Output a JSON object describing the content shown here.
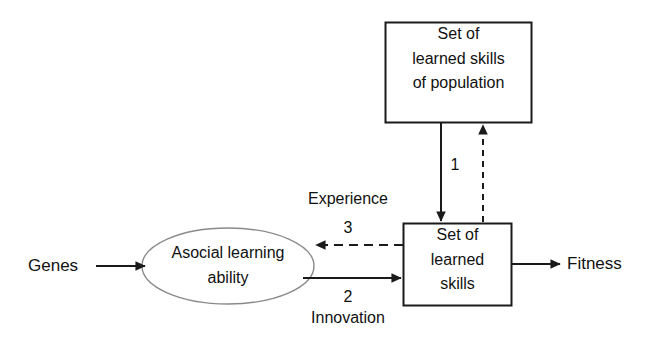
{
  "diagram": {
    "background_color": "#ffffff",
    "stroke_color": "#1a1a1a",
    "ellipse_stroke_color": "#8a8a8a",
    "text_color": "#111111",
    "nodes": {
      "population_skills": {
        "shape": "rectangle",
        "label": "Set of\nlearned skills\nof population"
      },
      "asocial_learning": {
        "shape": "ellipse",
        "label": "Asocial learning\nability"
      },
      "learned_skills": {
        "shape": "rectangle",
        "label": "Set of\nlearned\nskills"
      },
      "genes": {
        "shape": "text",
        "label": "Genes"
      },
      "fitness": {
        "shape": "text",
        "label": "Fitness"
      }
    },
    "edges": {
      "genes_to_ability": {
        "style": "solid",
        "direction": "right",
        "label": ""
      },
      "population_to_skills": {
        "style": "solid",
        "direction": "down",
        "label": "1"
      },
      "skills_to_population": {
        "style": "dashed",
        "direction": "up",
        "label": ""
      },
      "skills_to_ability": {
        "style": "dashed",
        "direction": "left",
        "label": "3",
        "name": "Experience"
      },
      "ability_to_skills": {
        "style": "solid",
        "direction": "right",
        "label": "2",
        "name": "Innovation"
      },
      "skills_to_fitness": {
        "style": "solid",
        "direction": "right",
        "label": ""
      }
    }
  }
}
